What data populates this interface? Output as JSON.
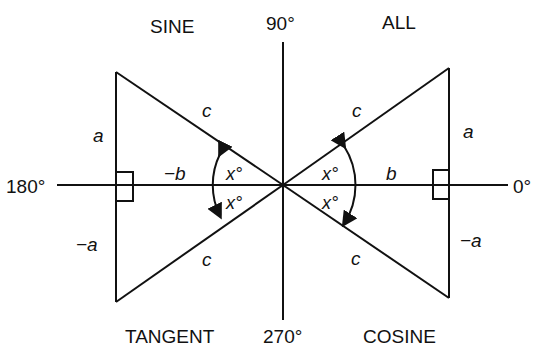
{
  "diagram": {
    "quadrants": {
      "top_left": "SINE",
      "top_right": "ALL",
      "bottom_left": "TANGENT",
      "bottom_right": "COSINE"
    },
    "axis_angles": {
      "top": "90°",
      "right": "0°",
      "left": "180°",
      "bottom": "270°"
    },
    "triangles": {
      "top_right": {
        "hypotenuse": "c",
        "opposite": "a",
        "adjacent": "b",
        "angle": "x°"
      },
      "top_left": {
        "hypotenuse": "c",
        "opposite": "a",
        "adjacent": "−b",
        "angle": "x°"
      },
      "bottom_left": {
        "hypotenuse": "c",
        "opposite": "−a",
        "angle": "x°"
      },
      "bottom_right": {
        "hypotenuse": "c",
        "opposite": "−a",
        "angle": "x°"
      }
    },
    "colors": {
      "line": "#111111",
      "background": "#ffffff"
    }
  }
}
